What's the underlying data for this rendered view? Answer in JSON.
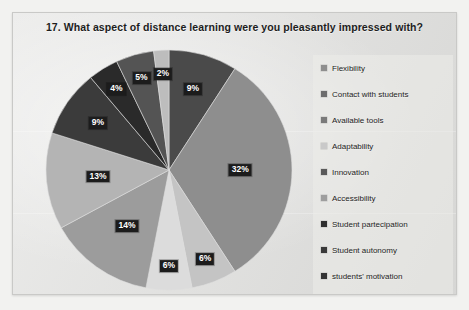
{
  "chart": {
    "title": "17. What aspect of distance learning were you pleasantly impressed with?"
  },
  "chart_data": {
    "type": "pie",
    "title": "17. What aspect of distance learning were you pleasantly impressed with?",
    "xlabel": "",
    "ylabel": "",
    "legend_position": "right",
    "grid": false,
    "units": "percent",
    "start_angle_deg": 0,
    "direction": "clockwise",
    "categories": [
      "Flexibility",
      "Contact with students",
      "Available tools",
      "Adaptability",
      "Innovation",
      "Accessibility",
      "Student partecipation",
      "Student autonomy",
      "students' motivation"
    ],
    "values": [
      32,
      6,
      6,
      14,
      13,
      9,
      4,
      5,
      2
    ],
    "data_labels": [
      "32%",
      "6%",
      "6%",
      "14%",
      "13%",
      "9%",
      "4%",
      "5%",
      "2%",
      "9%"
    ],
    "colors": [
      "#8e8e8e",
      "#d6d6d6",
      "#c2c2c2",
      "#9a9a9a",
      "#b0b0b0",
      "#3f3f3f",
      "#2b2b2b",
      "#515151",
      "#bdbdbd"
    ],
    "slices": [
      {
        "label": "9%",
        "value": 9,
        "category": "Accessibility",
        "color": "#4a4a4a",
        "pct_text": "9%"
      },
      {
        "label": "32%",
        "value": 32,
        "category": "Flexibility",
        "color": "#8e8e8e",
        "pct_text": "32%"
      },
      {
        "label": "6%",
        "value": 6,
        "category": "Contact with students",
        "color": "#c4c4c4",
        "pct_text": "6%"
      },
      {
        "label": "6%",
        "value": 6,
        "category": "Available tools",
        "color": "#dcdcdc",
        "pct_text": "6%"
      },
      {
        "label": "14%",
        "value": 14,
        "category": "Adaptability",
        "color": "#9c9c9c",
        "pct_text": "14%"
      },
      {
        "label": "13%",
        "value": 13,
        "category": "Innovation",
        "color": "#b4b4b4",
        "pct_text": "13%"
      },
      {
        "label": "9%",
        "value": 9,
        "category": "Student partecipation",
        "color": "#3b3b3b",
        "pct_text": "9%"
      },
      {
        "label": "4%",
        "value": 4,
        "category": "Student autonomy",
        "color": "#2a2a2a",
        "pct_text": "4%"
      },
      {
        "label": "5%",
        "value": 5,
        "category": "students' motivation",
        "color": "#545454",
        "pct_text": "5%"
      },
      {
        "label": "2%",
        "value": 2,
        "category": "students' motivation",
        "color": "#bdbdbd",
        "pct_text": "2%"
      }
    ]
  },
  "legend": {
    "items": [
      {
        "label": "Flexibility",
        "color": "#8e8e8e"
      },
      {
        "label": "Contact with students",
        "color": "#6d6d6d"
      },
      {
        "label": "Available tools",
        "color": "#7a7a7a"
      },
      {
        "label": "Adaptability",
        "color": "#c9c9c9"
      },
      {
        "label": "Innovation",
        "color": "#5a5a5a"
      },
      {
        "label": "Accessibility",
        "color": "#9e9e9e"
      },
      {
        "label": "Student partecipation",
        "color": "#2f2f2f"
      },
      {
        "label": "Student autonomy",
        "color": "#3a3a3a"
      },
      {
        "label": "students' motivation",
        "color": "#343434"
      }
    ]
  }
}
